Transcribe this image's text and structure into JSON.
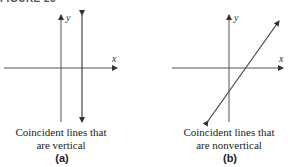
{
  "header": {
    "title": "FIGURE 25"
  },
  "panels": [
    {
      "id": "a",
      "label": "(a)",
      "caption_line1": "Coincident lines that",
      "caption_line2": "are vertical",
      "axes": {
        "x_label": "x",
        "y_label": "y"
      },
      "line_type": "vertical"
    },
    {
      "id": "b",
      "label": "(b)",
      "caption_line1": "Coincident lines that",
      "caption_line2": "are nonvertical",
      "axes": {
        "x_label": "x",
        "y_label": "y"
      },
      "line_type": "nonvertical"
    }
  ],
  "colors": {
    "line": "#444444",
    "text": "#222222"
  }
}
